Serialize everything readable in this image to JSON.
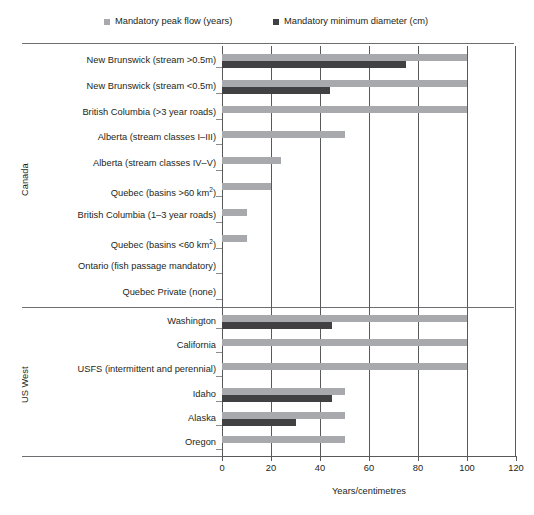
{
  "legend": {
    "entries": [
      {
        "label": "Mandatory peak flow (years)",
        "color": "#a7a9ac",
        "icon": "square-swatch-icon"
      },
      {
        "label": "Mandatory minimum diameter (cm)",
        "color": "#414042",
        "icon": "square-swatch-icon"
      }
    ]
  },
  "groups": [
    {
      "name": "Canada"
    },
    {
      "name": "US West"
    }
  ],
  "axis": {
    "x_title": "Years/centimetres",
    "x_ticks": [
      "0",
      "20",
      "40",
      "60",
      "80",
      "100",
      "120"
    ]
  },
  "chart_data": {
    "type": "bar",
    "orientation": "horizontal",
    "title": "",
    "subtitle": "",
    "xlabel": "Years/centimetres",
    "ylabel": "",
    "xlim": [
      0,
      120
    ],
    "xticks": [
      0,
      20,
      40,
      60,
      80,
      100,
      120
    ],
    "grid": true,
    "grid_axis": "x",
    "legend_position": "top",
    "group_labels": [
      "Canada",
      "US West"
    ],
    "groups": [
      {
        "name": "Canada",
        "categories": [
          "New Brunswick (stream >0.5m)",
          "New Brunswick (stream <0.5m)",
          "British Columbia (>3 year roads)",
          "Alberta (stream classes I–III)",
          "Alberta (stream classes IV–V)",
          "Quebec (basins >60 km2)",
          "British Columbia (1–3 year roads)",
          "Quebec (basins <60 km2)",
          "Ontario (fish passage mandatory)",
          "Quebec Private (none)"
        ]
      },
      {
        "name": "US West",
        "categories": [
          "Washington",
          "California",
          "USFS (intermittent and perennial)",
          "Idaho",
          "Alaska",
          "Oregon"
        ]
      }
    ],
    "categories": [
      "New Brunswick (stream >0.5m)",
      "New Brunswick (stream <0.5m)",
      "British Columbia (>3 year roads)",
      "Alberta (stream classes I–III)",
      "Alberta (stream classes IV–V)",
      "Quebec (basins >60 km2)",
      "British Columbia (1–3 year roads)",
      "Quebec (basins <60 km2)",
      "Ontario (fish passage mandatory)",
      "Quebec Private (none)",
      "Washington",
      "California",
      "USFS (intermittent and perennial)",
      "Idaho",
      "Alaska",
      "Oregon"
    ],
    "series": [
      {
        "name": "Mandatory peak flow (years)",
        "color": "#a7a9ac",
        "values": [
          100,
          100,
          100,
          50,
          24,
          20,
          10,
          10,
          0,
          0,
          100,
          100,
          100,
          50,
          50,
          50
        ]
      },
      {
        "name": "Mandatory minimum diameter (cm)",
        "color": "#414042",
        "values": [
          75,
          44,
          0,
          0,
          0,
          0,
          0,
          0,
          0,
          0,
          45,
          0,
          0,
          45,
          30,
          0
        ]
      }
    ]
  },
  "rows": [
    {
      "label": "New Brunswick (stream >0.5m)",
      "label_html": "New Brunswick (stream &gt;0.5m)",
      "peak": 100,
      "diam": 75
    },
    {
      "label": "New Brunswick (stream <0.5m)",
      "label_html": "New Brunswick (stream &lt;0.5m)",
      "peak": 100,
      "diam": 44
    },
    {
      "label": "British Columbia (>3 year roads)",
      "label_html": "British Columbia (&gt;3 year roads)",
      "peak": 100,
      "diam": 0
    },
    {
      "label": "Alberta (stream classes I–III)",
      "label_html": "Alberta (stream classes I–III)",
      "peak": 50,
      "diam": 0
    },
    {
      "label": "Alberta (stream classes IV–V)",
      "label_html": "Alberta (stream classes IV–V)",
      "peak": 24,
      "diam": 0
    },
    {
      "label": "Quebec (basins >60 km2)",
      "label_html": "Quebec (basins &gt;60 km<sup>2</sup>)",
      "peak": 20,
      "diam": 0
    },
    {
      "label": "British Columbia (1–3 year roads)",
      "label_html": "British Columbia (1–3 year roads)",
      "peak": 10,
      "diam": 0
    },
    {
      "label": "Quebec (basins <60 km2)",
      "label_html": "Quebec (basins &lt;60 km<sup>2</sup>)",
      "peak": 10,
      "diam": 0
    },
    {
      "label": "Ontario (fish passage mandatory)",
      "label_html": "Ontario (fish passage mandatory)",
      "peak": 0,
      "diam": 0
    },
    {
      "label": "Quebec Private (none)",
      "label_html": "Quebec Private (none)",
      "peak": 0,
      "diam": 0
    },
    {
      "label": "Washington",
      "label_html": "Washington",
      "peak": 100,
      "diam": 45
    },
    {
      "label": "California",
      "label_html": "California",
      "peak": 100,
      "diam": 0
    },
    {
      "label": "USFS (intermittent and perennial)",
      "label_html": "USFS (intermittent and perennial)",
      "peak": 100,
      "diam": 0
    },
    {
      "label": "Idaho",
      "label_html": "Idaho",
      "peak": 50,
      "diam": 45
    },
    {
      "label": "Alaska",
      "label_html": "Alaska",
      "peak": 50,
      "diam": 30
    },
    {
      "label": "Oregon",
      "label_html": "Oregon",
      "peak": 50,
      "diam": 0
    }
  ],
  "colors": {
    "peak_flow": "#a7a9ac",
    "min_diameter": "#414042",
    "axis": "#58595b",
    "text": "#231f20",
    "background": "#ffffff"
  }
}
